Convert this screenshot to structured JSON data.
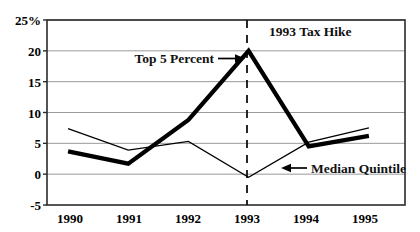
{
  "chart_data": {
    "type": "line",
    "title": "",
    "xlabel": "",
    "ylabel": "",
    "categories": [
      "1990",
      "1991",
      "1992",
      "1993",
      "1994",
      "1995"
    ],
    "x": [
      1990,
      1991,
      1992,
      1993,
      1994,
      1995
    ],
    "ylim": [
      -5,
      25
    ],
    "xlim": [
      1989.65,
      1995.6
    ],
    "yticks": [
      -5,
      0,
      5,
      10,
      15,
      20,
      25
    ],
    "ytick_labels": [
      "-5",
      "0",
      "5",
      "10",
      "15",
      "20",
      "25%"
    ],
    "xtick_labels": [
      "1990",
      "1991",
      "1992",
      "1993",
      "1994",
      "1995"
    ],
    "grid": "horizontal",
    "legend": "none",
    "series": [
      {
        "name": "Top 5 Percent",
        "style": "thick",
        "values": [
          3.7,
          1.7,
          8.8,
          20.0,
          4.5,
          6.2
        ]
      },
      {
        "name": "Median Quintile",
        "style": "thin",
        "values": [
          7.4,
          3.9,
          5.3,
          -0.5,
          5.2,
          7.5
        ]
      }
    ],
    "annotations": [
      {
        "id": "top5",
        "text": "Top 5 Percent",
        "arrow": "right",
        "target_x": 1993,
        "target_y": 20
      },
      {
        "id": "taxhike",
        "text": "1993 Tax Hike",
        "marker": "vertical-dashed-line",
        "at_x": 1993
      },
      {
        "id": "median",
        "text": "Median Quintile",
        "arrow": "left",
        "target_x": 1993.75,
        "target_y": 2.2
      }
    ]
  },
  "axis": {
    "y_labels": [
      "25%",
      "20",
      "15",
      "10",
      "5",
      "0",
      "-5"
    ],
    "x_labels": [
      "1990",
      "1991",
      "1992",
      "1993",
      "1994",
      "1995"
    ]
  },
  "annotations": {
    "top5_label": "Top 5 Percent",
    "taxhike_label": "1993 Tax Hike",
    "median_label": "Median Quintile"
  },
  "colors": {
    "background": "#ffffff",
    "axis": "#222222",
    "gridline": "#9a9a9a",
    "series_thick": "#000000",
    "series_thin": "#000000",
    "text": "#000000"
  }
}
